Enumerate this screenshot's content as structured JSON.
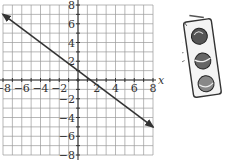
{
  "chart_data": {
    "type": "line",
    "title": "",
    "xlabel": "x",
    "ylabel": "y",
    "xlim": [
      -8,
      8
    ],
    "ylim": [
      -8,
      8
    ],
    "grid": true,
    "grid_step": 1,
    "x_tick_labels": [
      "−8",
      "−6",
      "−4",
      "−2",
      "2",
      "4",
      "6",
      "8"
    ],
    "y_tick_labels": [
      "8",
      "6",
      "4",
      "2",
      "−2",
      "−4",
      "−6",
      "−8"
    ],
    "x_ticks": [
      -8,
      -6,
      -4,
      -2,
      2,
      4,
      6,
      8
    ],
    "y_ticks": [
      8,
      6,
      4,
      2,
      -2,
      -4,
      -6,
      -8
    ],
    "series": [
      {
        "name": "line",
        "equation": "y = -3/4 x + 1",
        "x": [
          -8,
          8
        ],
        "y": [
          7,
          -5
        ],
        "arrows": "both",
        "color": "#333333"
      }
    ]
  },
  "illustration": {
    "name": "traffic-light",
    "description": "hand-drawn traffic light clip art"
  }
}
